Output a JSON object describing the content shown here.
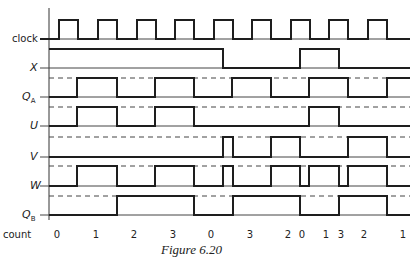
{
  "figure": {
    "caption": "Figure 6.20",
    "x_start": 49,
    "x_end": 410
  },
  "signals": [
    {
      "name": "clock",
      "label": "clock",
      "italic": false,
      "low_y": 39,
      "high_y": 20,
      "dashed": false,
      "initial": 0,
      "edges": [
        59,
        78,
        98,
        117,
        137,
        156,
        175,
        194,
        214,
        233,
        252,
        271,
        291,
        310,
        329,
        348,
        368,
        387
      ]
    },
    {
      "name": "x",
      "label": "X",
      "italic": true,
      "low_y": 68,
      "high_y": 49,
      "dashed": false,
      "initial": 1,
      "edges": [
        223,
        300,
        339
      ]
    },
    {
      "name": "qa",
      "label": "QA",
      "sub": "A",
      "italic": true,
      "low_y": 97,
      "high_y": 78,
      "dashed": true,
      "initial": 0,
      "edges": [
        77,
        117,
        155,
        194,
        232,
        271,
        309,
        348,
        387
      ]
    },
    {
      "name": "u",
      "label": "U",
      "italic": true,
      "low_y": 126,
      "high_y": 107,
      "dashed": true,
      "initial": 0,
      "edges": [
        77,
        117,
        155,
        194,
        309,
        339
      ]
    },
    {
      "name": "v",
      "label": "V",
      "italic": true,
      "low_y": 157,
      "high_y": 137,
      "dashed": true,
      "initial": 0,
      "edges": [
        223,
        233,
        271,
        300,
        348,
        387
      ]
    },
    {
      "name": "w",
      "label": "W",
      "italic": true,
      "low_y": 186,
      "high_y": 166,
      "dashed": true,
      "initial": 0,
      "edges": [
        77,
        117,
        155,
        194,
        223,
        233,
        271,
        300,
        309,
        339,
        348,
        387
      ]
    },
    {
      "name": "qb",
      "label": "QB",
      "sub": "B",
      "italic": true,
      "low_y": 215,
      "high_y": 196,
      "dashed": true,
      "initial": 0,
      "edges": [
        117,
        194,
        233,
        300,
        339,
        387
      ]
    }
  ],
  "count": {
    "label": "count",
    "values": [
      {
        "v": "0",
        "x": 57
      },
      {
        "v": "1",
        "x": 96
      },
      {
        "v": "2",
        "x": 134
      },
      {
        "v": "3",
        "x": 173
      },
      {
        "v": "0",
        "x": 211
      },
      {
        "v": "3",
        "x": 250
      },
      {
        "v": "2",
        "x": 288
      },
      {
        "v": "0",
        "x": 302
      },
      {
        "v": "1",
        "x": 326
      },
      {
        "v": "3",
        "x": 341
      },
      {
        "v": "2",
        "x": 364
      },
      {
        "v": "1",
        "x": 403
      }
    ]
  },
  "colors": {
    "ink": "#1e1e1e",
    "background": "#ffffff"
  }
}
